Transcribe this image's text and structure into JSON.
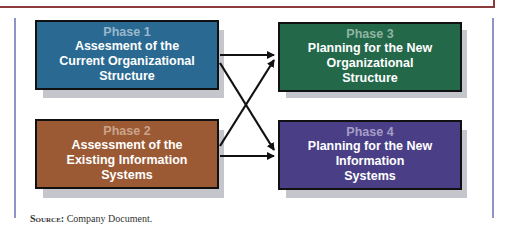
{
  "phases": [
    {
      "phase": "Phase 1",
      "title": "Assesment of the Current Organizational Structure",
      "lines": [
        "Assesment of the",
        "Current Organizational",
        "Structure"
      ],
      "color": "#2a6a92",
      "phase_color": "#9ab7cc"
    },
    {
      "phase": "Phase 2",
      "title": "Assessment of the Existing Information Systems",
      "lines": [
        "Assessment of the",
        "Existing Information",
        "Systems"
      ],
      "color": "#9c5a34",
      "phase_color": "#c9a48a"
    },
    {
      "phase": "Phase 3",
      "title": "Planning for the New Organizational Structure",
      "lines": [
        "Planning for the New",
        "Organizational",
        "Structure"
      ],
      "color": "#24684a",
      "phase_color": "#8fb5a3"
    },
    {
      "phase": "Phase 4",
      "title": "Planning for the New Information Systems",
      "lines": [
        "Planning for the New",
        "Information",
        "Systems"
      ],
      "color": "#4a3f86",
      "phase_color": "#a49ec6"
    }
  ],
  "source": {
    "label": "Source:",
    "text": " Company Document."
  }
}
